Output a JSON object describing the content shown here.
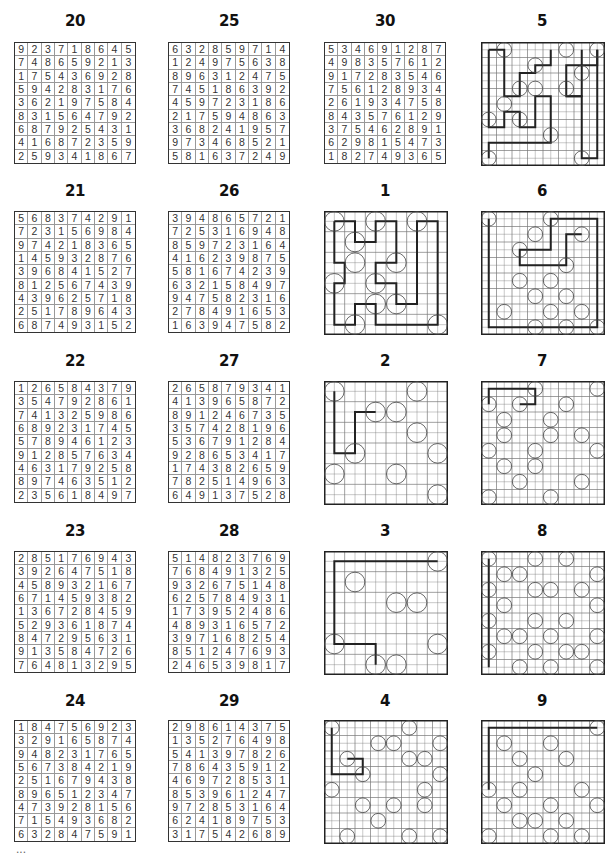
{
  "page": {
    "number_partial": "..."
  },
  "sudokus": [
    {
      "id": "20",
      "col": 0,
      "row": 0,
      "grid": [
        "923718645",
        "748659213",
        "175436928",
        "594283176",
        "362197584",
        "831564792",
        "687925431",
        "416872359",
        "259341867"
      ]
    },
    {
      "id": "21",
      "col": 0,
      "row": 1,
      "grid": [
        "568374291",
        "723156984",
        "974218365",
        "145932876",
        "396841527",
        "812567439",
        "439625718",
        "251789643",
        "687493152"
      ]
    },
    {
      "id": "22",
      "col": 0,
      "row": 2,
      "grid": [
        "126584379",
        "354792861",
        "741325986",
        "689231745",
        "578946123",
        "912857634",
        "463179258",
        "897463512",
        "235618497"
      ]
    },
    {
      "id": "23",
      "col": 0,
      "row": 3,
      "grid": [
        "285176943",
        "392647518",
        "458932167",
        "671459382",
        "136728459",
        "529361874",
        "847295631",
        "913584726",
        "764813295"
      ]
    },
    {
      "id": "24",
      "col": 0,
      "row": 4,
      "grid": [
        "184756923",
        "329165874",
        "948231765",
        "567384219",
        "251679438",
        "896512347",
        "473928156",
        "715493682",
        "632847591"
      ]
    },
    {
      "id": "25",
      "col": 1,
      "row": 0,
      "grid": [
        "632859714",
        "124975638",
        "896312475",
        "745186392",
        "459723186",
        "217594863",
        "368241957",
        "973468521",
        "581637249"
      ]
    },
    {
      "id": "26",
      "col": 1,
      "row": 1,
      "grid": [
        "394865721",
        "725316948",
        "859723164",
        "416239875",
        "581674239",
        "632158497",
        "947582316",
        "278491653",
        "163947582"
      ]
    },
    {
      "id": "27",
      "col": 1,
      "row": 2,
      "grid": [
        "265879341",
        "413965872",
        "891246735",
        "357428196",
        "536791284",
        "928653417",
        "174382659",
        "782514963",
        "649137528"
      ]
    },
    {
      "id": "28",
      "col": 1,
      "row": 3,
      "grid": [
        "514823769",
        "768491325",
        "932675148",
        "625784931",
        "173952486",
        "489316572",
        "397168254",
        "851247693",
        "246539817"
      ]
    },
    {
      "id": "29",
      "col": 1,
      "row": 4,
      "grid": [
        "298614375",
        "135276498",
        "541397826",
        "786435912",
        "469728531",
        "853961247",
        "972853164",
        "624189753",
        "317542689"
      ]
    },
    {
      "id": "30",
      "col": 2,
      "row": 0,
      "grid": [
        "534691287",
        "498357612",
        "917283546",
        "756128934",
        "261934758",
        "843576129",
        "375462891",
        "629815473",
        "182749365"
      ]
    }
  ],
  "mazes": [
    {
      "id": "5",
      "col": 3,
      "row": 0,
      "size": 8
    },
    {
      "id": "1",
      "col": 2,
      "row": 1,
      "size": 6
    },
    {
      "id": "6",
      "col": 3,
      "row": 1,
      "size": 8
    },
    {
      "id": "2",
      "col": 2,
      "row": 2,
      "size": 6
    },
    {
      "id": "7",
      "col": 3,
      "row": 2,
      "size": 8
    },
    {
      "id": "3",
      "col": 2,
      "row": 3,
      "size": 6
    },
    {
      "id": "8",
      "col": 3,
      "row": 3,
      "size": 8
    },
    {
      "id": "4",
      "col": 2,
      "row": 4,
      "size": 8
    },
    {
      "id": "9",
      "col": 3,
      "row": 4,
      "size": 8
    }
  ]
}
